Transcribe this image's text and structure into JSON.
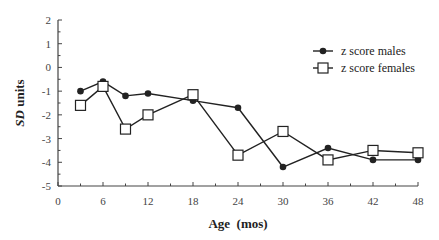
{
  "chart_data": {
    "type": "line",
    "title": "",
    "xlabel": "Age  (mos)",
    "ylabel_italic": "SD",
    "ylabel_rest": " units",
    "xlim": [
      0,
      48
    ],
    "ylim": [
      -5,
      2
    ],
    "xticks": [
      0,
      6,
      12,
      18,
      24,
      30,
      36,
      42,
      48
    ],
    "yticks": [
      2,
      1,
      0,
      -1,
      -2,
      -3,
      -4,
      -5
    ],
    "grid": false,
    "legend_position": "upper right",
    "x": [
      3,
      6,
      9,
      12,
      18,
      24,
      30,
      36,
      42,
      48
    ],
    "series": [
      {
        "name": "z score  males",
        "marker": "filled-circle",
        "values": [
          -1.0,
          -0.6,
          -1.2,
          -1.1,
          -1.4,
          -1.7,
          -4.2,
          -3.4,
          -3.9,
          -3.9
        ]
      },
      {
        "name": "z score females",
        "marker": "open-square",
        "values": [
          -1.6,
          -0.8,
          -2.6,
          -2.0,
          -1.15,
          -3.7,
          -2.7,
          -3.9,
          -3.5,
          -3.6
        ]
      }
    ]
  },
  "colors": {
    "line": "#222222",
    "axis": "#444444"
  }
}
